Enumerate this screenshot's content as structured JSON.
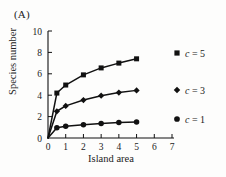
{
  "figure": {
    "panel_label": "(A)",
    "background_color": "#fdfdfc",
    "ink_color": "#111111"
  },
  "axes": {
    "xlabel": "Island area",
    "ylabel": "Species number",
    "x_ticks": [
      "0",
      "1",
      "2",
      "3",
      "4",
      "5",
      "6",
      "7"
    ],
    "y_ticks": [
      "0",
      "2",
      "4",
      "6",
      "8",
      "10"
    ]
  },
  "legend": {
    "items": [
      {
        "var": "c",
        "eq": "= 5",
        "text": "c = 5",
        "marker": "square"
      },
      {
        "var": "c",
        "eq": "= 3",
        "text": "c = 3",
        "marker": "diamond"
      },
      {
        "var": "c",
        "eq": "= 1",
        "text": "c = 1",
        "marker": "circle"
      }
    ]
  },
  "chart_data": {
    "type": "line",
    "title": "",
    "subtitle": "",
    "xlabel": "Island area",
    "ylabel": "Species number",
    "xlim": [
      0,
      7
    ],
    "ylim": [
      0,
      10
    ],
    "xticks": [
      0,
      1,
      2,
      3,
      4,
      5,
      6,
      7
    ],
    "yticks": [
      0,
      2,
      4,
      6,
      8,
      10
    ],
    "grid": false,
    "legend_position": "right-of-plot",
    "x": [
      0,
      0.5,
      1,
      2,
      3,
      4,
      5
    ],
    "series": [
      {
        "name": "c = 5",
        "marker": "square",
        "color": "#111111",
        "values": [
          0,
          4.2,
          4.95,
          5.9,
          6.55,
          7.0,
          7.4
        ]
      },
      {
        "name": "c = 3",
        "marker": "diamond",
        "color": "#111111",
        "values": [
          0,
          2.5,
          3.0,
          3.55,
          3.95,
          4.25,
          4.45
        ]
      },
      {
        "name": "c = 1",
        "marker": "circle",
        "color": "#111111",
        "values": [
          0,
          0.95,
          1.1,
          1.25,
          1.35,
          1.45,
          1.5
        ]
      }
    ]
  }
}
